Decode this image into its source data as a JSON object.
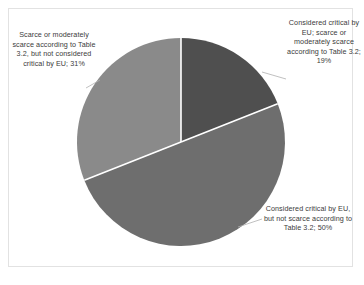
{
  "chart_data": {
    "type": "pie",
    "title": "",
    "categories": [
      "Considered critical by EU; scarce or moderately scarce according to Table 3.2",
      "Considered critical by EU, but not scarce according to Table 3.2",
      "Scarce or moderately scarce according to Table 3.2, but not considered critical by EU"
    ],
    "values": [
      19,
      50,
      31
    ],
    "value_unit": "%",
    "legend_position": "none",
    "labels_position": "outside",
    "grid": false,
    "start_angle_deg": 0,
    "direction": "clockwise",
    "slices": [
      {
        "name": "critical-scarce",
        "label": "Considered critical by EU; scarce or moderately scarce according to Table 3.2; 19%",
        "value": 19,
        "color": "#4f4f4f",
        "start_deg": 0,
        "end_deg": 68.4
      },
      {
        "name": "critical-not-scarce",
        "label": "Considered critical by EU, but not scarce according to Table 3.2; 50%",
        "value": 50,
        "color": "#6e6e6e",
        "start_deg": 68.4,
        "end_deg": 248.4
      },
      {
        "name": "scarce-not-critical",
        "label": "Scarce or moderately scarce according to Table 3.2, but not considered critical by EU; 31%",
        "value": 31,
        "color": "#8a8a8a",
        "start_deg": 248.4,
        "end_deg": 360
      }
    ],
    "colors": {
      "slice_critical_scarce": "#4f4f4f",
      "slice_critical_not_scarce": "#6e6e6e",
      "slice_scarce_not_critical": "#8a8a8a",
      "slice_divider": "#ffffff",
      "leader_line": "#b0b0b0",
      "frame_border": "#e2e2e2",
      "label_text": "#3b3b3b",
      "background": "#ffffff"
    }
  },
  "labels": {
    "critical_scarce": "Considered critical by EU; scarce or moderately scarce according to Table 3.2; 19%",
    "critical_not_scarce": "Considered critical by EU, but not scarce according to Table 3.2; 50%",
    "scarce_not_critical": "Scarce or moderately scarce according to Table 3.2, but not considered critical by EU; 31%"
  }
}
